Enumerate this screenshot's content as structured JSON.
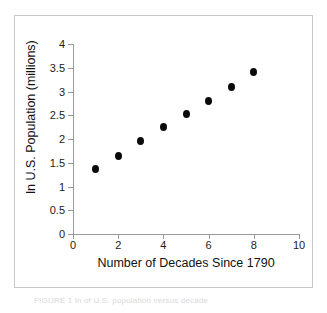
{
  "figure": {
    "caption": "FIGURE 1  ln of U.S. population versus decade"
  },
  "chart_data": {
    "type": "scatter",
    "title": "",
    "xlabel": "Number of Decades Since 1790",
    "ylabel": "ln U.S. Population (millions)",
    "xlim": [
      0,
      10
    ],
    "ylim": [
      0,
      4
    ],
    "xticks": [
      "0",
      "2",
      "4",
      "6",
      "8",
      "10"
    ],
    "xtick_values": [
      0,
      2,
      4,
      6,
      8,
      10
    ],
    "yticks": [
      "0",
      "0.5",
      "1",
      "1.5",
      "2",
      "2.5",
      "3",
      "3.5",
      "4"
    ],
    "ytick_values": [
      0,
      0.5,
      1,
      1.5,
      2,
      2.5,
      3,
      3.5,
      4
    ],
    "grid": false,
    "legend": null,
    "marker": "filled-circle",
    "marker_color": "#0a0a0a",
    "x": [
      1,
      2,
      3,
      4,
      5,
      6,
      7,
      8
    ],
    "y": [
      1.37,
      1.65,
      1.96,
      2.25,
      2.53,
      2.81,
      3.1,
      3.42
    ],
    "points": [
      {
        "x": 1,
        "y": 1.37
      },
      {
        "x": 2,
        "y": 1.65
      },
      {
        "x": 3,
        "y": 1.96
      },
      {
        "x": 4,
        "y": 2.25
      },
      {
        "x": 5,
        "y": 2.53
      },
      {
        "x": 6,
        "y": 2.81
      },
      {
        "x": 7,
        "y": 3.1
      },
      {
        "x": 8,
        "y": 3.42
      }
    ]
  }
}
